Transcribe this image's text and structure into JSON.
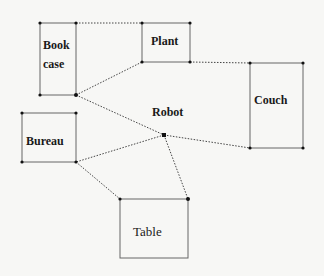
{
  "diagram": {
    "type": "room-layout",
    "nodes": [
      {
        "id": "bookcase",
        "label_line1": "Book",
        "label_line2": "case",
        "x": 40,
        "y": 23,
        "w": 36,
        "h": 72
      },
      {
        "id": "plant",
        "label": "Plant",
        "x": 142,
        "y": 23,
        "w": 48,
        "h": 39
      },
      {
        "id": "couch",
        "label": "Couch",
        "x": 250,
        "y": 63,
        "w": 53,
        "h": 85
      },
      {
        "id": "bureau",
        "label": "Bureau",
        "x": 22,
        "y": 113,
        "w": 54,
        "h": 49
      },
      {
        "id": "table",
        "label": "Table",
        "x": 120,
        "y": 199,
        "w": 68,
        "h": 59
      },
      {
        "id": "robot",
        "label": "Robot",
        "x": 164,
        "y": 135
      }
    ],
    "edges": [
      {
        "from": "bookcase-top-right",
        "to": "plant-top-left",
        "style": "dotted"
      },
      {
        "from": "bookcase-bottom-right",
        "to": "plant-bottom-left",
        "style": "dotted"
      },
      {
        "from": "plant-bottom-right",
        "to": "couch-top-left",
        "style": "dotted"
      },
      {
        "from": "bookcase-bottom-right",
        "to": "robot",
        "style": "dotted"
      },
      {
        "from": "robot",
        "to": "couch-bottom-left",
        "style": "dotted"
      },
      {
        "from": "robot",
        "to": "bureau-bottom-right",
        "style": "dotted"
      },
      {
        "from": "robot",
        "to": "table-top-right",
        "style": "dotted"
      },
      {
        "from": "bureau-bottom-right",
        "to": "table-top-left",
        "style": "dotted"
      }
    ]
  },
  "colors": {
    "line": "#555555",
    "dot": "#111111",
    "background": "#f7f7f5"
  }
}
